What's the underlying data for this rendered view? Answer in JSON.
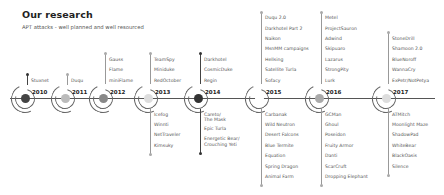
{
  "header": {
    "title": "Our research",
    "subtitle": "APT attacks - well planned and well resourced"
  },
  "timeline": {
    "years": [
      {
        "year": "2010",
        "x": 25,
        "dot_color": "#444444",
        "above": [
          "Stuxnet"
        ],
        "below": []
      },
      {
        "year": "2011",
        "x": 65,
        "dot_color": "#bbbbbb",
        "above": [
          "Duqu"
        ],
        "below": []
      },
      {
        "year": "2012",
        "x": 103,
        "dot_color": "#888888",
        "above": [
          "Gauss",
          "Flame",
          "miniFlame"
        ],
        "below": []
      },
      {
        "year": "2013",
        "x": 148,
        "dot_color": "#dddddd",
        "above": [
          "TeamSpy",
          "Miniduke",
          "RedOctober"
        ],
        "below": [
          "Icefog",
          "Winnti",
          "NetTraveler",
          "Kimsuky"
        ]
      },
      {
        "year": "2014",
        "x": 198,
        "dot_color": "#333333",
        "above": [
          "Darkhotel",
          "CosmicDuke",
          "Regin"
        ],
        "below": [
          "Careto/ The Mask",
          "Epic Turla",
          "Energetic Bear/ Crouching Yeti"
        ]
      },
      {
        "year": "2015",
        "x": 259,
        "dot_color": "#ffffff",
        "above": [
          "Duqu 2.0",
          "Darkhotel Part 2",
          "Naikon",
          "MsnMM campaigns",
          "Hellsing",
          "Satellite Turla",
          "Sofacy"
        ],
        "below": [
          "Carbanak",
          "Wild Neutron",
          "Desert Falcons",
          "Blue Termite",
          "Equation",
          "Spring Dragon",
          "Animal Farm"
        ]
      },
      {
        "year": "2016",
        "x": 319,
        "dot_color": "#aaaaaa",
        "above": [
          "Metel",
          "ProjectSauron",
          "Adwind",
          "Skipuaro",
          "Lazarus",
          "StrongPity",
          "Lurk"
        ],
        "below": [
          "GCMan",
          "Ghoul",
          "Poseidon",
          "Fruity Armor",
          "Danti",
          "ScarCruft",
          "Dropping Elephant"
        ]
      },
      {
        "year": "2017",
        "x": 386,
        "dot_color": "#dddddd",
        "above": [
          "StoneDrill",
          "Shamoon 2.0",
          "BlueNoroff",
          "WannaCry",
          "ExPetr/NotPetya"
        ],
        "below": [
          "ATMitch",
          "Moonlight Maze",
          "ShadowPad",
          "WhiteBear",
          "BlackOasis",
          "Silence"
        ]
      }
    ]
  },
  "colors": {
    "axis": "#555555",
    "text": "#555555",
    "title": "#222222"
  }
}
